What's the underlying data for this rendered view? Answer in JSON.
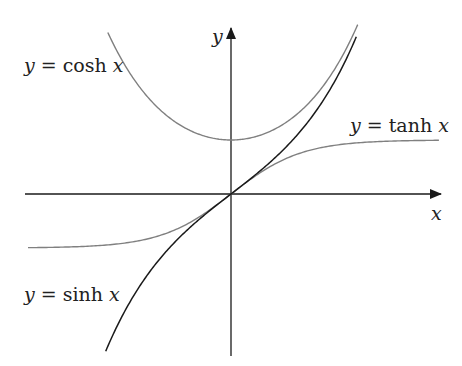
{
  "chart_data": {
    "type": "line",
    "title": "",
    "xlabel": "x",
    "ylabel": "y",
    "grid": false,
    "legend": "inline labels",
    "xlim": [
      -2.9,
      3.0
    ],
    "ylim": [
      -3.0,
      3.1
    ],
    "series": [
      {
        "name": "y = cosh x",
        "func": "cosh",
        "x_range": [
          -1.76,
          1.81
        ],
        "color": "#808080",
        "points": [
          [
            -1.76,
            2.99
          ],
          [
            -1.0,
            1.54
          ],
          [
            0,
            1.0
          ],
          [
            1.0,
            1.54
          ],
          [
            1.81,
            3.14
          ]
        ]
      },
      {
        "name": "y = sinh x",
        "func": "sinh",
        "x_range": [
          -1.79,
          1.79
        ],
        "color": "#1a1a1a",
        "points": [
          [
            -1.79,
            -2.91
          ],
          [
            -1.0,
            -1.18
          ],
          [
            0,
            0
          ],
          [
            1.0,
            1.18
          ],
          [
            1.79,
            2.91
          ]
        ]
      },
      {
        "name": "y = tanh x",
        "func": "tanh",
        "x_range": [
          -2.9,
          2.97
        ],
        "color": "#808080",
        "points": [
          [
            -2.9,
            -0.99
          ],
          [
            -1.0,
            -0.76
          ],
          [
            0,
            0
          ],
          [
            1.0,
            0.76
          ],
          [
            2.97,
            0.99
          ]
        ]
      }
    ],
    "annotations": [
      "y = cosh x",
      "y = tanh x",
      "y = sinh x"
    ]
  },
  "labels": {
    "cosh": {
      "y": "y",
      "eq": " = cosh ",
      "x": "x"
    },
    "tanh": {
      "y": "y",
      "eq": " = tanh ",
      "x": "x"
    },
    "sinh": {
      "y": "y",
      "eq": " = sinh ",
      "x": "x"
    },
    "x_axis": "x",
    "y_axis": "y"
  },
  "colors": {
    "axis": "#1a1a1a",
    "light_curve": "#808080",
    "dark_curve": "#1a1a1a"
  }
}
